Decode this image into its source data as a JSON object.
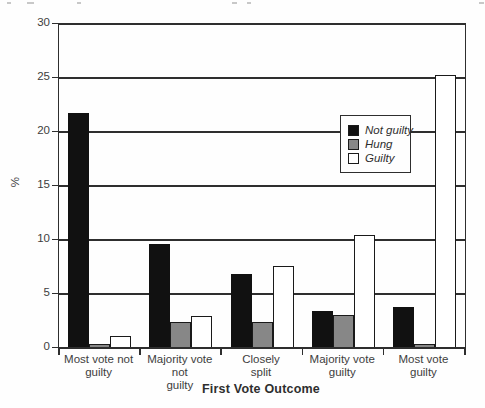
{
  "chart_data": {
    "type": "bar",
    "title": "",
    "xlabel": "First Vote Outcome",
    "ylabel": "%",
    "ylim": [
      0,
      30
    ],
    "y_ticks": [
      0,
      5,
      10,
      15,
      20,
      25,
      30
    ],
    "grid": "horizontal gridlines every 5 units",
    "legend_position": "inside plot, upper right",
    "categories": [
      "Most vote not guilty",
      "Majority vote not guilty",
      "Closely split",
      "Majority vote guilty",
      "Most vote guilty"
    ],
    "x_tick_display": [
      "Most vote not\nguilty",
      "Majority vote not\nguilty",
      "Closely\nsplit",
      "Majority vote\nguilty",
      "Most vote\nguilty"
    ],
    "series": [
      {
        "name": "Not guilty",
        "color": "#111111",
        "values": [
          21.7,
          9.5,
          6.8,
          3.3,
          3.7
        ]
      },
      {
        "name": "Hung",
        "color": "#878787",
        "values": [
          0.3,
          2.3,
          2.3,
          3.0,
          0.3
        ]
      },
      {
        "name": "Guilty",
        "color": "#ffffff",
        "values": [
          1.0,
          2.9,
          7.5,
          10.4,
          25.2
        ]
      }
    ],
    "colors": {
      "line": "#2e2e2e",
      "text": "#3d3d3d",
      "background": "#fefefe"
    }
  }
}
